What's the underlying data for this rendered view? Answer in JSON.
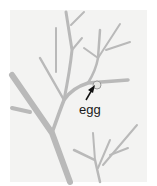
{
  "illustration": {
    "subject": "branching plant stems with insect egg",
    "label": "egg",
    "colors": {
      "background": "#f3f3f2",
      "branch": "#b9b9b9",
      "branch_shadow": "#9a9a9a",
      "egg": "#e6e6e3",
      "arrow": "#111111"
    }
  }
}
